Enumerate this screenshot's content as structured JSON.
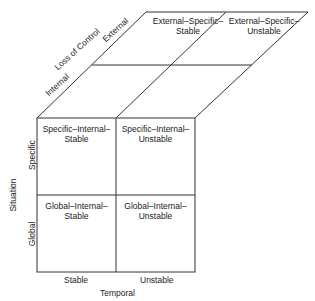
{
  "diagram": {
    "type": "3d-attribution-cube",
    "front_face": {
      "cells": [
        {
          "id": "specific-internal-stable",
          "line1": "Specific–Internal–",
          "line2": "Stable"
        },
        {
          "id": "specific-internal-unstable",
          "line1": "Specific–Internal–",
          "line2": "Unstable"
        },
        {
          "id": "global-internal-stable",
          "line1": "Global–Internal–",
          "line2": "Stable"
        },
        {
          "id": "global-internal-unstable",
          "line1": "Global–Internal–",
          "line2": "Unstable"
        }
      ]
    },
    "top_face": {
      "cells": [
        {
          "id": "external-specific-stable",
          "line1": "External–Specific–",
          "line2": "Stable"
        },
        {
          "id": "external-specific-unstable",
          "line1": "External–Specific–",
          "line2": "Unstable"
        }
      ]
    },
    "axes": {
      "temporal": {
        "title": "Temporal",
        "ticks": [
          "Stable",
          "Unstable"
        ]
      },
      "situation": {
        "title": "Situation",
        "ticks": [
          "Specific",
          "Global"
        ]
      },
      "locus_of_control": {
        "title": "Loss of Control",
        "ticks": [
          "Internal",
          "External"
        ]
      }
    },
    "line_color": "#333333"
  }
}
